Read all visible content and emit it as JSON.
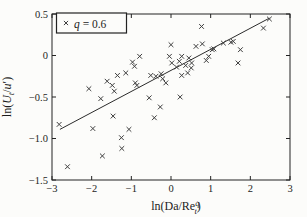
{
  "figure": {
    "background": "#fcfcfa"
  },
  "chart_data": {
    "type": "scatter",
    "title": "",
    "xlabel": "ln(Da/Re_t^q)",
    "ylabel": "ln(U_t/u′)",
    "xlabel_parts": {
      "pre": "ln(Da/Re",
      "sup": "q",
      "sub": "t",
      "post": ")"
    },
    "ylabel_parts": {
      "pre": "ln(U",
      "sub": "t",
      "post": "/u′)"
    },
    "xlim": [
      -3,
      3
    ],
    "ylim": [
      -1.5,
      0.5
    ],
    "xticks": [
      -3,
      -2,
      -1,
      0,
      1,
      2,
      3
    ],
    "xtick_labels": [
      "−3",
      "−2",
      "−1",
      "0",
      "1",
      "2",
      "3"
    ],
    "yticks": [
      0.5,
      0,
      -0.5,
      -1.0,
      -1.5
    ],
    "ytick_labels": [
      "0.5",
      "0",
      "−0.5",
      "−1.0",
      "−1.5"
    ],
    "grid": false,
    "box": true,
    "tick_direction": "in",
    "legend": {
      "position": "top-left",
      "marker": "×",
      "var": "q",
      "rest": " = 0.6",
      "label": "q = 0.6"
    },
    "colors": {
      "marker": "#3f3f3f",
      "fit_line": "#2b2b2b",
      "axis": "#222222",
      "text": "#1c1c1c",
      "legend_fill": "#fcfcfa"
    },
    "fit_line": {
      "x1": -2.8,
      "y1": -0.89,
      "x2": 2.48,
      "y2": 0.45
    },
    "series": [
      {
        "name": "q = 0.6",
        "marker": "x",
        "points": [
          [
            -2.82,
            -0.83
          ],
          [
            -2.61,
            -1.34
          ],
          [
            -2.07,
            -0.4
          ],
          [
            -1.97,
            -0.88
          ],
          [
            -1.77,
            -0.52
          ],
          [
            -1.73,
            -1.21
          ],
          [
            -1.61,
            -0.31
          ],
          [
            -1.48,
            -0.36
          ],
          [
            -1.46,
            -0.73
          ],
          [
            -1.43,
            -0.43
          ],
          [
            -1.35,
            -0.24
          ],
          [
            -1.25,
            -0.99
          ],
          [
            -1.24,
            -1.12
          ],
          [
            -1.14,
            -0.21
          ],
          [
            -1.06,
            -0.89
          ],
          [
            -0.97,
            -0.08
          ],
          [
            -0.92,
            -0.13
          ],
          [
            -0.9,
            -0.33
          ],
          [
            -0.86,
            -0.36
          ],
          [
            -0.79,
            -0.01
          ],
          [
            -0.55,
            -0.51
          ],
          [
            -0.51,
            -0.24
          ],
          [
            -0.42,
            -0.75
          ],
          [
            -0.38,
            -0.25
          ],
          [
            -0.27,
            -0.62
          ],
          [
            -0.25,
            -0.22
          ],
          [
            -0.21,
            -0.28
          ],
          [
            -0.13,
            -0.33
          ],
          [
            0.0,
            0.13
          ],
          [
            -0.04,
            -0.01
          ],
          [
            0.02,
            -0.09
          ],
          [
            0.14,
            -0.14
          ],
          [
            0.21,
            -0.07
          ],
          [
            0.23,
            -0.5
          ],
          [
            0.27,
            -0.01
          ],
          [
            0.27,
            -0.24
          ],
          [
            0.37,
            -0.12
          ],
          [
            0.42,
            -0.21
          ],
          [
            0.45,
            -0.03
          ],
          [
            0.51,
            -0.15
          ],
          [
            0.52,
            -0.09
          ],
          [
            0.63,
            0.11
          ],
          [
            0.77,
            0.35
          ],
          [
            0.79,
            0.14
          ],
          [
            0.89,
            -0.06
          ],
          [
            0.95,
            -0.01
          ],
          [
            1.04,
            0.07
          ],
          [
            1.08,
            0.08
          ],
          [
            1.32,
            0.15
          ],
          [
            1.51,
            0.16
          ],
          [
            1.57,
            0.17
          ],
          [
            1.69,
            -0.09
          ],
          [
            1.75,
            0.07
          ],
          [
            2.33,
            0.33
          ],
          [
            2.48,
            0.44
          ]
        ]
      }
    ]
  }
}
